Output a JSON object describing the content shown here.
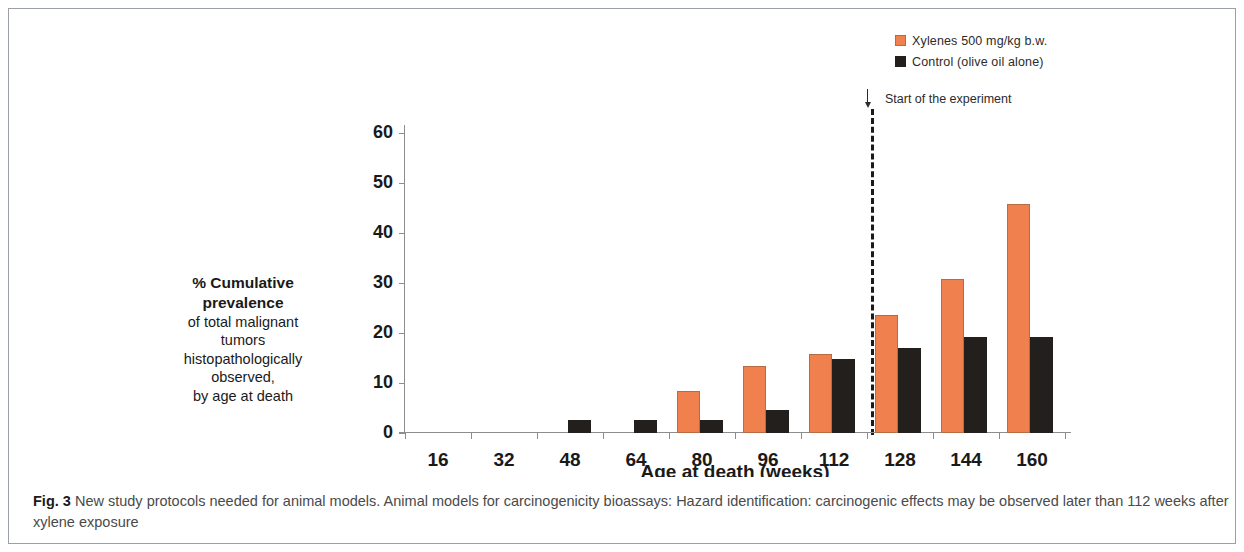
{
  "chart_data": {
    "type": "bar",
    "title": "",
    "xlabel": "Age at death (weeks)",
    "ylabel": "% Cumulative prevalence of total malignant tumors histopathologically observed, by age at death",
    "categories": [
      "16",
      "32",
      "48",
      "64",
      "80",
      "96",
      "112",
      "128",
      "144",
      "160"
    ],
    "ylim": [
      0,
      60
    ],
    "yticks": [
      "0",
      "10",
      "20",
      "30",
      "40",
      "50",
      "60"
    ],
    "grid": false,
    "legend_position": "top-right",
    "series": [
      {
        "name": "Xylenes 500 mg/kg b.w.",
        "color": "#f0804e",
        "values": [
          0,
          0,
          0,
          0,
          8.0,
          13.0,
          15.5,
          23.2,
          30.5,
          45.5
        ]
      },
      {
        "name": "Control (olive oil alone)",
        "color": "#231f1c",
        "values": [
          0,
          0,
          2.2,
          2.2,
          2.2,
          4.3,
          14.5,
          16.6,
          18.8,
          18.8
        ]
      }
    ],
    "annotations": [
      {
        "name": "start-of-experiment",
        "text": "Start of the experiment",
        "marker": "down-arrow",
        "divider": "dashed-vertical",
        "between_categories": [
          "112",
          "128"
        ]
      }
    ]
  },
  "legend": {
    "items": [
      {
        "label": "Xylenes 500 mg/kg b.w."
      },
      {
        "label": "Control (olive oil alone)"
      }
    ]
  },
  "axes": {
    "x_title": "Age at death (weeks)",
    "y_title_lines": [
      "% Cumulative",
      "prevalence",
      "of total malignant",
      "tumors",
      "histopathologically",
      "observed,",
      "by age at death"
    ]
  },
  "caption": {
    "figure_number": "Fig. 3",
    "text": "New study protocols needed for animal models. Animal models for carcinogenicity bioassays: Hazard identification: carcinogenic effects may be observed later than 112 weeks after xylene exposure"
  }
}
